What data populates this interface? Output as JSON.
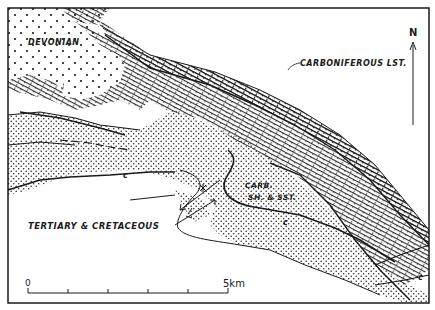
{
  "map": {
    "units": {
      "devonian": {
        "label": "DEVONIAN",
        "pattern": "sparse-dots"
      },
      "carboniferous_limestone": {
        "label": "CARBONIFEROUS LST.",
        "pattern": "brick"
      },
      "carboniferous_shale_sandstone": {
        "label_line1": "CARB.",
        "label_line2": "SH. & SST.",
        "pattern": "dense-dots"
      },
      "tertiary_cretaceous": {
        "label": "TERTIARY & CRETACEOUS",
        "pattern": "blank"
      }
    },
    "north_arrow": {
      "label": "N"
    },
    "scale_bar": {
      "start_label": "0",
      "end_label": "5km",
      "ticks": 5
    },
    "contact_marks": [
      "c",
      "c",
      "c",
      "c"
    ],
    "colors": {
      "ink": "#1a1a1a",
      "paper": "#ffffff"
    }
  }
}
